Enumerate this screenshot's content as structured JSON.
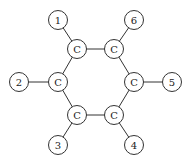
{
  "diagram": {
    "title": "",
    "nodes": [
      {
        "id": "c1",
        "label": "C",
        "kind": "carbon"
      },
      {
        "id": "c2",
        "label": "C",
        "kind": "carbon"
      },
      {
        "id": "c3",
        "label": "C",
        "kind": "carbon"
      },
      {
        "id": "c4",
        "label": "C",
        "kind": "carbon"
      },
      {
        "id": "c5",
        "label": "C",
        "kind": "carbon"
      },
      {
        "id": "c6",
        "label": "C",
        "kind": "carbon"
      },
      {
        "id": "s1",
        "label": "1",
        "kind": "substituent"
      },
      {
        "id": "s2",
        "label": "2",
        "kind": "substituent"
      },
      {
        "id": "s3",
        "label": "3",
        "kind": "substituent"
      },
      {
        "id": "s4",
        "label": "4",
        "kind": "substituent"
      },
      {
        "id": "s5",
        "label": "5",
        "kind": "substituent"
      },
      {
        "id": "s6",
        "label": "6",
        "kind": "substituent"
      }
    ],
    "edges": [
      [
        "c1",
        "c6"
      ],
      [
        "c1",
        "c2"
      ],
      [
        "c2",
        "c3"
      ],
      [
        "c3",
        "c4"
      ],
      [
        "c4",
        "c5"
      ],
      [
        "c5",
        "c6"
      ],
      [
        "c1",
        "s1"
      ],
      [
        "c2",
        "s2"
      ],
      [
        "c3",
        "s3"
      ],
      [
        "c4",
        "s4"
      ],
      [
        "c5",
        "s5"
      ],
      [
        "c6",
        "s6"
      ]
    ]
  }
}
